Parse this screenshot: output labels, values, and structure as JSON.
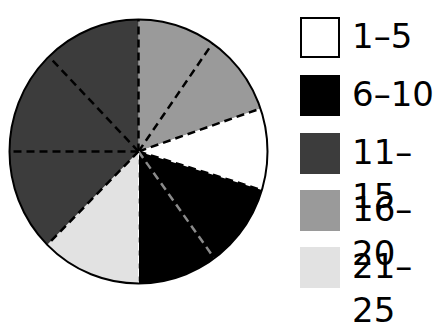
{
  "chart_data": {
    "type": "pie",
    "title": "",
    "start_angle_deg": 0,
    "direction": "clockwise",
    "slices": [
      {
        "label": "16–20",
        "start": 0,
        "end": 71,
        "value_pct": 19.7,
        "color": "#9a9a9a"
      },
      {
        "label": "1–5",
        "start": 71,
        "end": 107,
        "value_pct": 10.0,
        "color": "#ffffff"
      },
      {
        "label": "6–10",
        "start": 107,
        "end": 180,
        "value_pct": 20.3,
        "color": "#000000"
      },
      {
        "label": "21–25",
        "start": 180,
        "end": 225,
        "value_pct": 12.5,
        "color": "#e2e2e2"
      },
      {
        "label": "11–15",
        "start": 225,
        "end": 360,
        "value_pct": 37.5,
        "color": "#3c3c3c"
      }
    ],
    "dashed_lines_deg": [
      0,
      35,
      71,
      107,
      144,
      180,
      225,
      270,
      316
    ],
    "legend": {
      "position": "right",
      "entries": [
        {
          "label": "1–5",
          "color": "#ffffff"
        },
        {
          "label": "6–10",
          "color": "#000000"
        },
        {
          "label": "11–15",
          "color": "#3c3c3c"
        },
        {
          "label": "16–20",
          "color": "#9a9a9a"
        },
        {
          "label": "21–25",
          "color": "#e2e2e2"
        }
      ]
    }
  },
  "legend": {
    "items": [
      {
        "label": "1–5"
      },
      {
        "label": "6–10"
      },
      {
        "label": "11–15"
      },
      {
        "label": "16–20"
      },
      {
        "label": "21–25"
      }
    ]
  }
}
